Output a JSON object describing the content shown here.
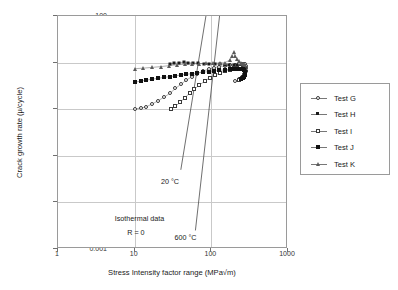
{
  "chart_data": {
    "type": "scatter",
    "title": "",
    "xlabel": "Stress Intensity factor range (MPa√m)",
    "ylabel": "Crack growth rate (µ/cycle)",
    "xscale": "log",
    "yscale": "log",
    "xlim": [
      1,
      1000
    ],
    "ylim": [
      0.001,
      100
    ],
    "xticks": [
      "1",
      "10",
      "100",
      "1000"
    ],
    "xtick_values": [
      1,
      10,
      100,
      1000
    ],
    "yticks": [
      "0.001",
      "0.01",
      "0.1",
      "1",
      "10",
      "100"
    ],
    "ytick_values": [
      0.001,
      0.01,
      0.1,
      1,
      10,
      100
    ],
    "grid": true,
    "legend_position": "right-outside",
    "annotations": [
      {
        "text": "20 °C",
        "x": 22,
        "y": 0.035
      },
      {
        "text": "600 °C",
        "x": 33,
        "y": 0.0022
      },
      {
        "text": "Isothermal data",
        "x": 5.5,
        "y": 0.0055
      },
      {
        "text": "R = 0",
        "x": 8.0,
        "y": 0.0028
      }
    ],
    "reference_lines": [
      {
        "name": "20 °C",
        "x": [
          40,
          85
        ],
        "y": [
          0.05,
          100
        ]
      },
      {
        "name": "600 °C",
        "x": [
          62,
          128
        ],
        "y": [
          0.0025,
          100
        ]
      }
    ],
    "series": [
      {
        "name": "Test G",
        "marker": "open-circle",
        "line": true,
        "points": [
          [
            10,
            1.02
          ],
          [
            12,
            1.05
          ],
          [
            14,
            1.12
          ],
          [
            17,
            1.3
          ],
          [
            20,
            1.5
          ],
          [
            24,
            1.8
          ],
          [
            29,
            2.2
          ],
          [
            34,
            2.8
          ],
          [
            40,
            3.4
          ],
          [
            47,
            4.2
          ],
          [
            56,
            5.0
          ],
          [
            66,
            5.8
          ],
          [
            78,
            6.6
          ],
          [
            92,
            7.2
          ],
          [
            108,
            7.8
          ],
          [
            127,
            8.2
          ],
          [
            150,
            8.5
          ],
          [
            176,
            8.8
          ],
          [
            205,
            9.0
          ],
          [
            230,
            9.2
          ],
          [
            250,
            9.4
          ],
          [
            265,
            9.4
          ],
          [
            275,
            9.2
          ],
          [
            282,
            8.6
          ],
          [
            285,
            7.6
          ],
          [
            280,
            6.6
          ],
          [
            268,
            5.6
          ],
          [
            250,
            4.9
          ],
          [
            228,
            4.4
          ],
          [
            205,
            4.0
          ]
        ]
      },
      {
        "name": "Test H",
        "marker": "small-filled",
        "line": true,
        "points": [
          [
            29,
            9.2
          ],
          [
            33,
            9.6
          ],
          [
            38,
            10.0
          ],
          [
            44,
            10.2
          ],
          [
            50,
            10.0
          ],
          [
            58,
            9.8
          ],
          [
            68,
            9.6
          ],
          [
            80,
            9.5
          ],
          [
            94,
            9.4
          ],
          [
            110,
            9.3
          ],
          [
            128,
            9.2
          ],
          [
            150,
            9.1
          ],
          [
            172,
            9.0
          ],
          [
            196,
            8.9
          ],
          [
            218,
            8.8
          ],
          [
            238,
            8.6
          ],
          [
            255,
            8.4
          ],
          [
            268,
            8.0
          ],
          [
            276,
            7.4
          ],
          [
            280,
            6.6
          ],
          [
            278,
            5.8
          ],
          [
            270,
            5.2
          ],
          [
            258,
            4.8
          ],
          [
            244,
            4.5
          ],
          [
            228,
            4.3
          ]
        ]
      },
      {
        "name": "Test I",
        "marker": "open-square",
        "line": true,
        "points": [
          [
            30,
            1.0
          ],
          [
            34,
            1.15
          ],
          [
            39,
            1.4
          ],
          [
            45,
            1.75
          ],
          [
            52,
            2.2
          ],
          [
            60,
            2.7
          ],
          [
            70,
            3.3
          ],
          [
            82,
            4.0
          ],
          [
            95,
            4.7
          ],
          [
            111,
            5.4
          ],
          [
            130,
            6.0
          ],
          [
            152,
            6.6
          ],
          [
            176,
            7.1
          ],
          [
            200,
            7.5
          ],
          [
            222,
            7.8
          ],
          [
            240,
            8.0
          ],
          [
            255,
            8.0
          ],
          [
            266,
            7.8
          ],
          [
            273,
            7.2
          ],
          [
            276,
            6.4
          ],
          [
            272,
            5.6
          ],
          [
            262,
            5.0
          ],
          [
            248,
            4.6
          ],
          [
            232,
            4.3
          ]
        ]
      },
      {
        "name": "Test J",
        "marker": "filled-square",
        "line": true,
        "points": [
          [
            10,
            3.8
          ],
          [
            12,
            4.0
          ],
          [
            14,
            4.2
          ],
          [
            17,
            4.4
          ],
          [
            20,
            4.6
          ],
          [
            24,
            4.8
          ],
          [
            29,
            5.0
          ],
          [
            34,
            5.2
          ],
          [
            40,
            5.4
          ],
          [
            47,
            5.6
          ],
          [
            56,
            5.8
          ],
          [
            66,
            6.0
          ],
          [
            78,
            6.2
          ],
          [
            92,
            6.4
          ],
          [
            108,
            6.6
          ],
          [
            127,
            6.8
          ],
          [
            150,
            7.0
          ],
          [
            176,
            7.2
          ],
          [
            200,
            7.3
          ],
          [
            222,
            7.4
          ],
          [
            240,
            7.4
          ],
          [
            256,
            7.2
          ],
          [
            266,
            6.8
          ],
          [
            272,
            6.2
          ],
          [
            274,
            5.5
          ],
          [
            268,
            5.0
          ],
          [
            256,
            4.6
          ],
          [
            242,
            4.4
          ]
        ]
      },
      {
        "name": "Test K",
        "marker": "open-triangle",
        "line": true,
        "points": [
          [
            10,
            7.4
          ],
          [
            13,
            7.6
          ],
          [
            17,
            7.9
          ],
          [
            22,
            8.2
          ],
          [
            28,
            8.6
          ],
          [
            36,
            9.0
          ],
          [
            45,
            9.2
          ],
          [
            56,
            9.4
          ],
          [
            70,
            9.5
          ],
          [
            86,
            9.6
          ],
          [
            105,
            9.7
          ],
          [
            128,
            9.8
          ],
          [
            152,
            10.0
          ],
          [
            175,
            11.5
          ],
          [
            188,
            14.0
          ],
          [
            196,
            16.5
          ],
          [
            205,
            14.0
          ],
          [
            215,
            12.0
          ],
          [
            228,
            10.6
          ],
          [
            242,
            9.8
          ],
          [
            256,
            9.4
          ],
          [
            268,
            9.2
          ],
          [
            277,
            9.0
          ]
        ]
      }
    ],
    "legend": [
      {
        "label": "Test G",
        "marker": "open-circle"
      },
      {
        "label": "Test H",
        "marker": "small-filled"
      },
      {
        "label": "Test I",
        "marker": "open-square"
      },
      {
        "label": "Test J",
        "marker": "filled-square"
      },
      {
        "label": "Test K",
        "marker": "open-triangle"
      }
    ]
  },
  "axes": {
    "y_title": "Crack growth rate (µ/cycle)",
    "x_title": "Stress Intensity factor range (MPa√m)"
  },
  "colors": {
    "frame": "#9a9a9a",
    "grid": "#c9c9c9",
    "marker_dark": "#1a1a1a",
    "marker_mid": "#5a5a5a",
    "line": "#777777",
    "text": "#1a1a1a"
  }
}
